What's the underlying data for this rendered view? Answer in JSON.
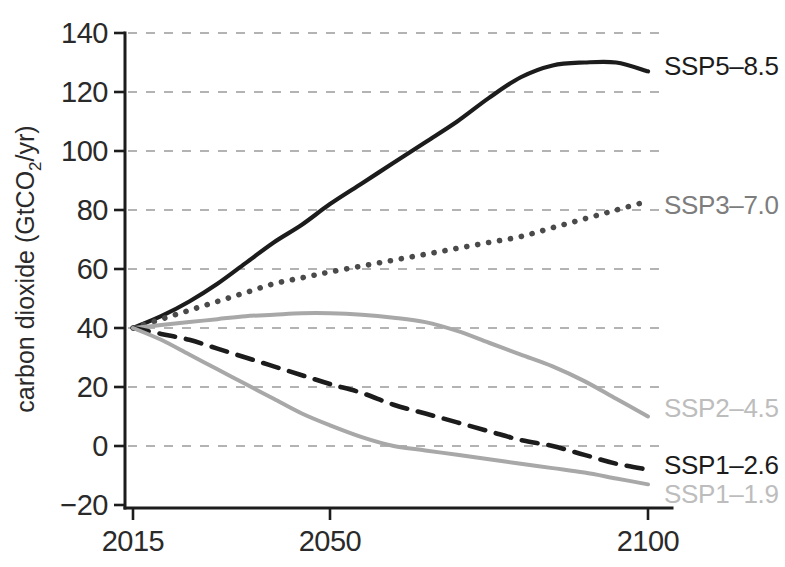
{
  "chart_data": {
    "type": "line",
    "title": "",
    "xlabel": "",
    "ylabel": "carbon dioxide (GtCO2/yr)",
    "ylabel_parts": {
      "pre": "carbon dioxide (GtCO",
      "sub": "2",
      "post": "/yr)"
    },
    "xlim": [
      2015,
      2100
    ],
    "ylim": [
      -20,
      140
    ],
    "grid": true,
    "grid_axis": "y",
    "legend_position": "right-inline",
    "x_ticks": [
      2015,
      2050,
      2100
    ],
    "x_tick_labels": [
      "2015",
      "2050",
      "2100"
    ],
    "y_ticks": [
      -20,
      0,
      20,
      40,
      60,
      80,
      100,
      120,
      140
    ],
    "y_tick_labels": [
      "−20",
      "0",
      "20",
      "40",
      "60",
      "80",
      "100",
      "120",
      "140"
    ],
    "x": [
      2015,
      2020,
      2025,
      2030,
      2035,
      2040,
      2045,
      2050,
      2055,
      2060,
      2065,
      2070,
      2075,
      2080,
      2085,
      2090,
      2095,
      2100
    ],
    "series": [
      {
        "name": "SSP5-8.5",
        "label": "SSP5–8.5",
        "color": "#1c1c1c",
        "style": "solid",
        "width": 4.2,
        "label_color": "#1c1c1c",
        "label_y": 128,
        "values": [
          40,
          44,
          49,
          55,
          62,
          69,
          75,
          82,
          89,
          96,
          103,
          110,
          118,
          125,
          129,
          130,
          130,
          127
        ]
      },
      {
        "name": "SSP3-7.0",
        "label": "SSP3–7.0",
        "color": "#4a4a4a",
        "style": "dotted",
        "width": 5.6,
        "label_color": "#7d7d7d",
        "label_y": 81,
        "values": [
          40,
          43,
          46,
          49,
          52,
          55,
          57,
          59,
          61,
          63,
          65,
          67,
          69,
          71,
          74,
          77,
          80,
          83
        ]
      },
      {
        "name": "SSP2-4.5",
        "label": "SSP2–4.5",
        "color": "#a8a8a8",
        "style": "solid",
        "width": 4.0,
        "label_color": "#bdbdbd",
        "label_y": 12,
        "values": [
          40,
          41,
          42,
          43,
          44,
          44.5,
          45,
          45,
          44.5,
          43.5,
          42,
          39,
          35,
          31,
          27,
          22,
          16,
          10
        ]
      },
      {
        "name": "SSP1-2.6",
        "label": "SSP1–2.6",
        "color": "#1c1c1c",
        "style": "dashed",
        "width": 4.6,
        "label_color": "#1c1c1c",
        "label_y": -7,
        "values": [
          40,
          38,
          36,
          33,
          30,
          27,
          24,
          21,
          18,
          14,
          11,
          8,
          5,
          2,
          0,
          -3,
          -6,
          -8
        ]
      },
      {
        "name": "SSP1-1.9",
        "label": "SSP1–1.9",
        "color": "#a8a8a8",
        "style": "solid",
        "width": 4.0,
        "label_color": "#bdbdbd",
        "label_y": -17,
        "values": [
          40,
          36,
          31,
          26,
          21,
          16,
          11,
          7,
          3,
          0,
          -1.5,
          -3,
          -4.5,
          -6,
          -7.5,
          -9,
          -11,
          -13
        ]
      }
    ]
  },
  "plot": {
    "left": 128,
    "right": 660,
    "top": 33,
    "bottom": 505,
    "axis_x": 125,
    "axis_y": 508,
    "x2015": 133,
    "x2050": 330,
    "x2100": 648,
    "label_x": 664
  },
  "colors": {
    "background": "#ffffff",
    "axis": "#1c1c1c",
    "grid": "#9a9a9a",
    "text": "#2a2a2a"
  }
}
